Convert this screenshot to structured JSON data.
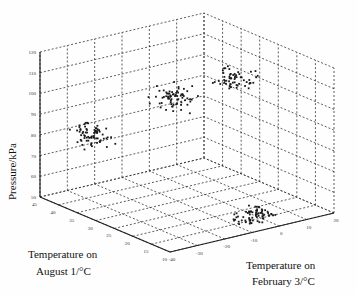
{
  "chart_data": {
    "type": "scatter",
    "subtype": "3d-scatter",
    "title": "",
    "xlabel": "Temperature on February 3/°C",
    "ylabel": "Temperature on August 1/°C",
    "zlabel": "Pressure/kPa",
    "xlim": [
      -40,
      20
    ],
    "ylim": [
      10,
      45
    ],
    "zlim": [
      50,
      120
    ],
    "x_ticks": [
      "-40",
      "-30",
      "-20",
      "-10",
      "0",
      "10",
      "20"
    ],
    "y_ticks": [
      "45",
      "40",
      "35",
      "30",
      "25",
      "20",
      "15",
      "10"
    ],
    "z_ticks": [
      "120",
      "110",
      "100",
      "90",
      "80",
      "70",
      "60",
      "50"
    ],
    "grid": true,
    "legend": null,
    "clusters": [
      {
        "name": "cluster-high-cold",
        "x_center": -25,
        "y_center": 20,
        "z_center": 112,
        "spread": [
          4,
          3,
          4
        ],
        "count": 70
      },
      {
        "name": "cluster-high-warm",
        "x_center": 5,
        "y_center": 25,
        "z_center": 108,
        "spread": [
          4,
          3,
          4
        ],
        "count": 60
      },
      {
        "name": "cluster-mid",
        "x_center": -30,
        "y_center": 38,
        "z_center": 82,
        "spread": [
          4,
          3,
          4
        ],
        "count": 70
      },
      {
        "name": "cluster-low",
        "x_center": -5,
        "y_center": 12,
        "z_center": 55,
        "spread": [
          5,
          2,
          3
        ],
        "count": 70
      }
    ]
  },
  "labels": {
    "zaxis": "Pressure/kPa",
    "yaxis_line1": "Temperature on",
    "yaxis_line2": "August 1/°C",
    "xaxis_line1": "Temperature on",
    "xaxis_line2": "February 3/°C"
  }
}
